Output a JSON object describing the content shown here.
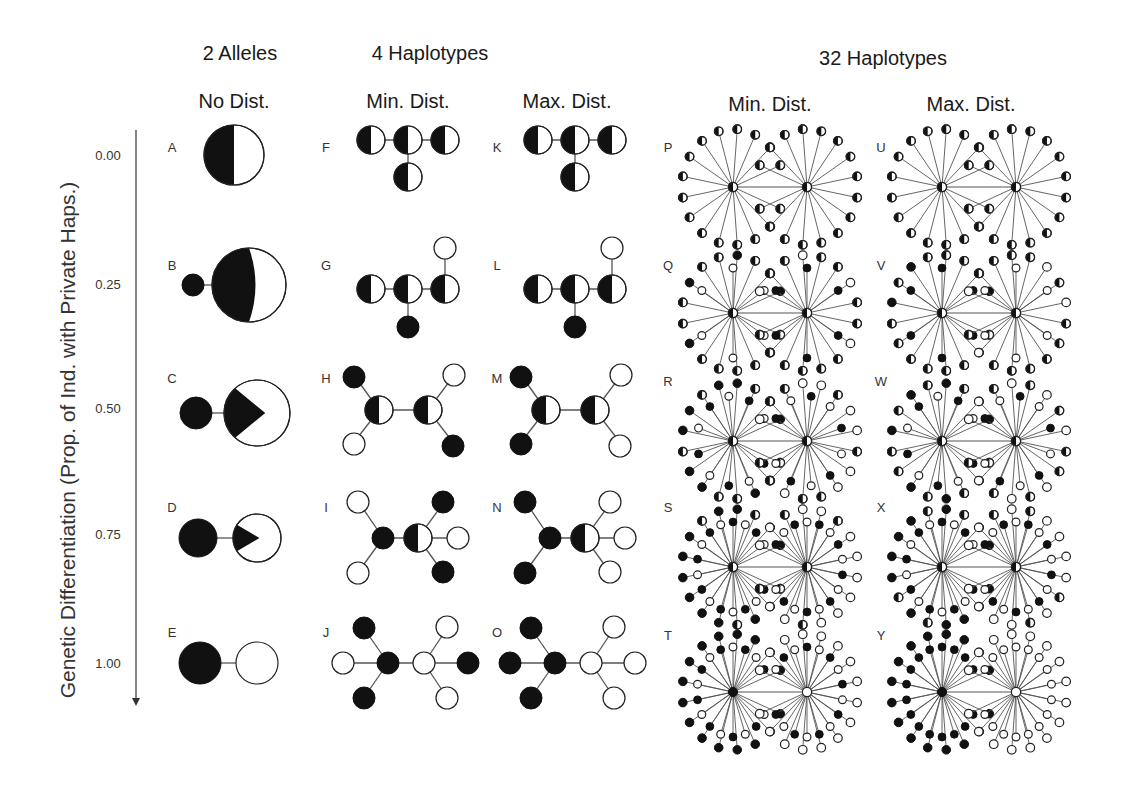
{
  "figure": {
    "y_axis_label": "Genetic Differentiation (Prop. of Ind. with Private Haps.)",
    "y_ticks": [
      {
        "label": "0.00",
        "y": 155
      },
      {
        "label": "0.25",
        "y": 284
      },
      {
        "label": "0.50",
        "y": 408
      },
      {
        "label": "0.75",
        "y": 534
      },
      {
        "label": "1.00",
        "y": 663
      }
    ],
    "axis_arrow": {
      "x": 136,
      "y1": 130,
      "y2": 706
    },
    "group_headers": [
      {
        "label": "2 Alleles",
        "x": 240,
        "y": 53
      },
      {
        "label": "4 Haplotypes",
        "x": 430,
        "y": 53
      },
      {
        "label": "32 Haplotypes",
        "x": 883,
        "y": 58
      }
    ],
    "column_headers": [
      {
        "label": "No Dist.",
        "x": 234,
        "y": 101
      },
      {
        "label": "Min. Dist.",
        "x": 408,
        "y": 101
      },
      {
        "label": "Max. Dist.",
        "x": 567,
        "y": 101
      },
      {
        "label": "Min. Dist.",
        "x": 770,
        "y": 104
      },
      {
        "label": "Max. Dist.",
        "x": 971,
        "y": 104
      }
    ],
    "colors": {
      "ink": "#111111",
      "line": "#555555",
      "fill_white": "#ffffff"
    }
  },
  "panels": [
    {
      "letter": "A",
      "lx": 172,
      "ly": 147,
      "type": "two",
      "diff": 0.0,
      "cy": 155
    },
    {
      "letter": "B",
      "lx": 172,
      "ly": 265,
      "type": "two",
      "diff": 0.25,
      "cy": 285
    },
    {
      "letter": "C",
      "lx": 172,
      "ly": 378,
      "type": "two",
      "diff": 0.5,
      "cy": 413
    },
    {
      "letter": "D",
      "lx": 172,
      "ly": 507,
      "type": "two",
      "diff": 0.75,
      "cy": 538
    },
    {
      "letter": "E",
      "lx": 172,
      "ly": 632,
      "type": "two",
      "diff": 1.0,
      "cy": 663
    },
    {
      "letter": "F",
      "lx": 326,
      "ly": 147,
      "type": "four",
      "variant": "min",
      "row": 0,
      "cx": 408,
      "cy": 147
    },
    {
      "letter": "G",
      "lx": 326,
      "ly": 265,
      "type": "four",
      "variant": "min",
      "row": 1,
      "cx": 408,
      "cy": 285
    },
    {
      "letter": "H",
      "lx": 326,
      "ly": 378,
      "type": "four",
      "variant": "min",
      "row": 2,
      "cx": 408,
      "cy": 410
    },
    {
      "letter": "I",
      "lx": 326,
      "ly": 507,
      "type": "four",
      "variant": "min",
      "row": 3,
      "cx": 408,
      "cy": 538
    },
    {
      "letter": "J",
      "lx": 326,
      "ly": 632,
      "type": "four",
      "variant": "min",
      "row": 4,
      "cx": 408,
      "cy": 663
    },
    {
      "letter": "K",
      "lx": 497,
      "ly": 147,
      "type": "four",
      "variant": "max",
      "row": 0,
      "cx": 575,
      "cy": 147
    },
    {
      "letter": "L",
      "lx": 497,
      "ly": 265,
      "type": "four",
      "variant": "max",
      "row": 1,
      "cx": 575,
      "cy": 285
    },
    {
      "letter": "M",
      "lx": 497,
      "ly": 378,
      "type": "four",
      "variant": "max",
      "row": 2,
      "cx": 575,
      "cy": 410
    },
    {
      "letter": "N",
      "lx": 497,
      "ly": 507,
      "type": "four",
      "variant": "max",
      "row": 3,
      "cx": 575,
      "cy": 538
    },
    {
      "letter": "O",
      "lx": 497,
      "ly": 632,
      "type": "four",
      "variant": "max",
      "row": 4,
      "cx": 575,
      "cy": 663
    },
    {
      "letter": "P",
      "lx": 668,
      "ly": 147,
      "type": "thirtytwo",
      "variant": "min",
      "row": 0,
      "cx": 770,
      "cy": 187
    },
    {
      "letter": "Q",
      "lx": 668,
      "ly": 265,
      "type": "thirtytwo",
      "variant": "min",
      "row": 1,
      "cx": 770,
      "cy": 313
    },
    {
      "letter": "R",
      "lx": 668,
      "ly": 381,
      "type": "thirtytwo",
      "variant": "min",
      "row": 2,
      "cx": 770,
      "cy": 441
    },
    {
      "letter": "S",
      "lx": 668,
      "ly": 507,
      "type": "thirtytwo",
      "variant": "min",
      "row": 3,
      "cx": 770,
      "cy": 567
    },
    {
      "letter": "T",
      "lx": 668,
      "ly": 635,
      "type": "thirtytwo",
      "variant": "min",
      "row": 4,
      "cx": 770,
      "cy": 692
    },
    {
      "letter": "U",
      "lx": 881,
      "ly": 147,
      "type": "thirtytwo",
      "variant": "max",
      "row": 0,
      "cx": 979,
      "cy": 187
    },
    {
      "letter": "V",
      "lx": 881,
      "ly": 265,
      "type": "thirtytwo",
      "variant": "max",
      "row": 1,
      "cx": 979,
      "cy": 313
    },
    {
      "letter": "W",
      "lx": 881,
      "ly": 381,
      "type": "thirtytwo",
      "variant": "max",
      "row": 2,
      "cx": 979,
      "cy": 441
    },
    {
      "letter": "X",
      "lx": 881,
      "ly": 507,
      "type": "thirtytwo",
      "variant": "max",
      "row": 3,
      "cx": 979,
      "cy": 567
    },
    {
      "letter": "Y",
      "lx": 881,
      "ly": 635,
      "type": "thirtytwo",
      "variant": "max",
      "row": 4,
      "cx": 979,
      "cy": 692
    }
  ]
}
